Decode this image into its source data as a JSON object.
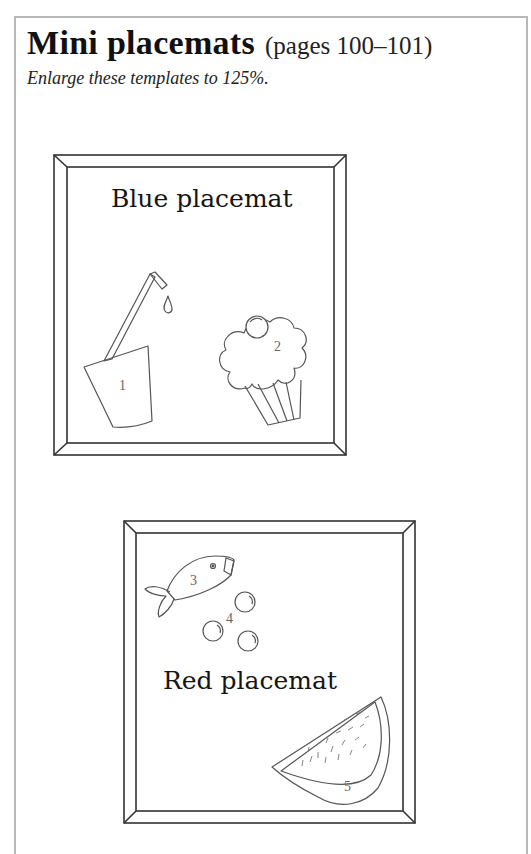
{
  "header": {
    "title": "Mini placemats",
    "pages": "(pages 100–101)",
    "subtitle": "Enlarge these templates to 125%."
  },
  "placemats": [
    {
      "label": "Blue placemat",
      "items": [
        {
          "number": "1",
          "icon": "glass-with-straw-icon"
        },
        {
          "number": "2",
          "icon": "cupcake-icon"
        }
      ]
    },
    {
      "label": "Red placemat",
      "items": [
        {
          "number": "3",
          "icon": "fish-icon"
        },
        {
          "number": "4",
          "icon": "bubbles-icon"
        },
        {
          "number": "5",
          "icon": "watermelon-slice-icon"
        }
      ]
    }
  ],
  "colors": {
    "page_border": "#b9b9b9",
    "line_art": "#555555",
    "frame": "#333333"
  }
}
